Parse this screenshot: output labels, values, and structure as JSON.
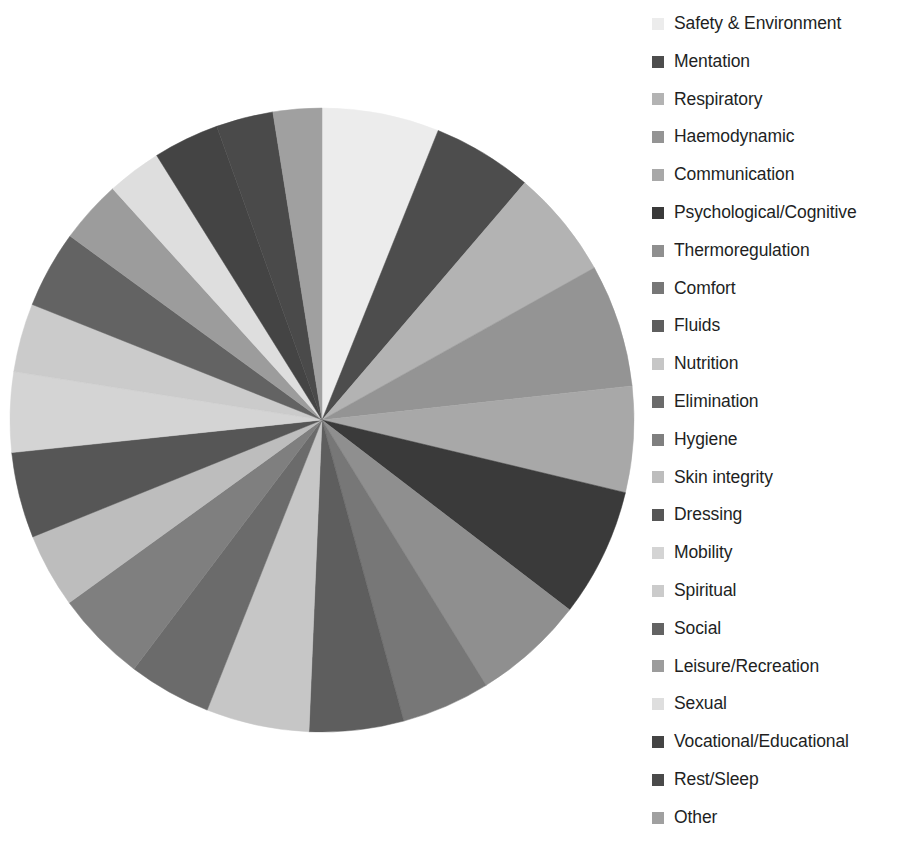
{
  "chart_data": {
    "type": "pie",
    "title": "",
    "subtitle": "",
    "xlabel": "",
    "ylabel": "",
    "legend_position": "right",
    "grid": false,
    "start_angle_deg": 0,
    "direction": "clockwise",
    "center": {
      "x": 322,
      "y": 420
    },
    "radius": 312,
    "categories": [
      "Safety & Environment",
      "Mentation",
      "Respiratory",
      "Haemodynamic",
      "Communication",
      "Psychological/Cognitive",
      "Thermoregulation",
      "Comfort",
      "Fluids",
      "Nutrition",
      "Elimination",
      "Hygiene",
      "Skin integrity",
      "Dressing",
      "Mobility",
      "Spiritual",
      "Social",
      "Leisure/Recreation",
      "Sexual",
      "Vocational/Educational",
      "Rest/Sleep",
      "Other"
    ],
    "values": [
      8.2,
      7.0,
      7.6,
      8.6,
      7.4,
      9.0,
      7.8,
      6.2,
      6.6,
      7.2,
      5.8,
      6.4,
      5.2,
      6.0,
      5.6,
      4.8,
      5.4,
      4.4,
      3.8,
      4.6,
      4.0,
      3.4
    ],
    "colors": [
      "#ececec",
      "#4d4d4d",
      "#b3b3b3",
      "#949494",
      "#a8a8a8",
      "#3a3a3a",
      "#8f8f8f",
      "#777777",
      "#5e5e5e",
      "#c6c6c6",
      "#6b6b6b",
      "#7f7f7f",
      "#bdbdbd",
      "#565656",
      "#d4d4d4",
      "#cbcbcb",
      "#636363",
      "#9c9c9c",
      "#dedede",
      "#444444",
      "#4a4a4a",
      "#a0a0a0"
    ]
  },
  "legend": {
    "items": [
      {
        "label": "Safety & Environment",
        "color": "#ececec"
      },
      {
        "label": "Mentation",
        "color": "#4d4d4d"
      },
      {
        "label": "Respiratory",
        "color": "#b3b3b3"
      },
      {
        "label": "Haemodynamic",
        "color": "#949494"
      },
      {
        "label": "Communication",
        "color": "#a8a8a8"
      },
      {
        "label": "Psychological/Cognitive",
        "color": "#3a3a3a"
      },
      {
        "label": "Thermoregulation",
        "color": "#8f8f8f"
      },
      {
        "label": "Comfort",
        "color": "#777777"
      },
      {
        "label": "Fluids",
        "color": "#5e5e5e"
      },
      {
        "label": "Nutrition",
        "color": "#c6c6c6"
      },
      {
        "label": "Elimination",
        "color": "#6b6b6b"
      },
      {
        "label": "Hygiene",
        "color": "#7f7f7f"
      },
      {
        "label": "Skin integrity",
        "color": "#bdbdbd"
      },
      {
        "label": "Dressing",
        "color": "#565656"
      },
      {
        "label": "Mobility",
        "color": "#d4d4d4"
      },
      {
        "label": "Spiritual",
        "color": "#cbcbcb"
      },
      {
        "label": "Social",
        "color": "#636363"
      },
      {
        "label": "Leisure/Recreation",
        "color": "#9c9c9c"
      },
      {
        "label": "Sexual",
        "color": "#dedede"
      },
      {
        "label": "Vocational/Educational",
        "color": "#444444"
      },
      {
        "label": "Rest/Sleep",
        "color": "#4a4a4a"
      },
      {
        "label": "Other",
        "color": "#a0a0a0"
      }
    ]
  },
  "theme": {
    "background": "#ffffff",
    "text_color": "#221f1f"
  }
}
